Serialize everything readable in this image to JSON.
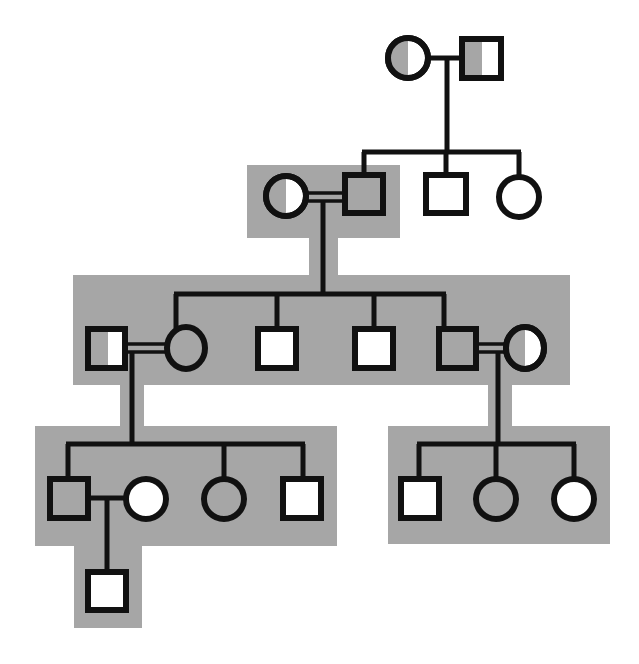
{
  "diagram": {
    "type": "pedigree",
    "colors": {
      "background": "#ffffff",
      "highlight": "#a6a6a6",
      "affected": "#a6a6a6",
      "unaffected": "#ffffff",
      "stroke": "#111111"
    },
    "generations": [
      {
        "id": "I",
        "members": [
          {
            "id": "I-1",
            "sex": "female",
            "status": "carrier"
          },
          {
            "id": "I-2",
            "sex": "male",
            "status": "carrier"
          }
        ]
      },
      {
        "id": "II",
        "members": [
          {
            "id": "II-1",
            "sex": "female",
            "status": "carrier",
            "note": "married-in, consanguineous union"
          },
          {
            "id": "II-2",
            "sex": "male",
            "status": "affected"
          },
          {
            "id": "II-3",
            "sex": "male",
            "status": "unaffected"
          },
          {
            "id": "II-4",
            "sex": "female",
            "status": "unaffected"
          }
        ]
      },
      {
        "id": "III",
        "members": [
          {
            "id": "III-1",
            "sex": "male",
            "status": "carrier",
            "note": "married-in, consanguineous union"
          },
          {
            "id": "III-2",
            "sex": "female",
            "status": "affected"
          },
          {
            "id": "III-3",
            "sex": "male",
            "status": "unaffected"
          },
          {
            "id": "III-4",
            "sex": "male",
            "status": "unaffected"
          },
          {
            "id": "III-5",
            "sex": "male",
            "status": "affected"
          },
          {
            "id": "III-6",
            "sex": "female",
            "status": "carrier",
            "note": "married-in, consanguineous union"
          }
        ]
      },
      {
        "id": "IV",
        "members": [
          {
            "id": "IV-1",
            "sex": "male",
            "status": "affected"
          },
          {
            "id": "IV-2",
            "sex": "female",
            "status": "unaffected",
            "note": "married-in"
          },
          {
            "id": "IV-3",
            "sex": "female",
            "status": "affected"
          },
          {
            "id": "IV-4",
            "sex": "male",
            "status": "unaffected"
          },
          {
            "id": "IV-5",
            "sex": "male",
            "status": "unaffected"
          },
          {
            "id": "IV-6",
            "sex": "female",
            "status": "affected"
          },
          {
            "id": "IV-7",
            "sex": "female",
            "status": "unaffected"
          }
        ]
      },
      {
        "id": "V",
        "members": [
          {
            "id": "V-1",
            "sex": "male",
            "status": "unaffected"
          }
        ]
      }
    ]
  }
}
